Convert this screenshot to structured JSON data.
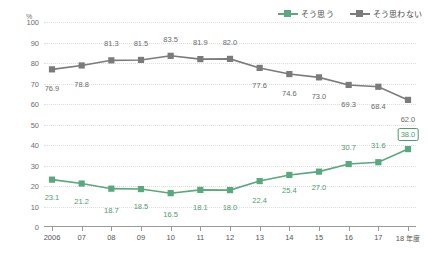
{
  "chart_data": {
    "type": "line",
    "title": "",
    "xlabel": "",
    "ylabel": "",
    "unit_label": "%",
    "x_axis_unit_suffix": "年度",
    "grid": true,
    "legend_position": "top-right",
    "ylim": [
      0,
      100
    ],
    "y_ticks": [
      "100",
      "90",
      "80",
      "70",
      "60",
      "50",
      "40",
      "30",
      "20",
      "10",
      "0"
    ],
    "categories": [
      "2006",
      "07",
      "08",
      "09",
      "10",
      "11",
      "12",
      "13",
      "14",
      "15",
      "16",
      "17",
      "18"
    ],
    "last_category_suffix": "年度",
    "series": [
      {
        "name": "そう思う",
        "color": "#5aa87d",
        "label_color": "#4f9a73",
        "values": [
          23.1,
          21.2,
          18.7,
          18.5,
          16.5,
          18.1,
          18.0,
          22.4,
          25.4,
          27.0,
          30.7,
          31.6,
          38.0
        ],
        "value_labels": [
          "23.1",
          "21.2",
          "18.7",
          "18.5",
          "16.5",
          "18.1",
          "18.0",
          "22.4",
          "25.4",
          "27.0",
          "30.7",
          "31.6",
          "38.0"
        ],
        "highlight_last_label": true
      },
      {
        "name": "そう思わない",
        "color": "#7b7b7b",
        "label_color": "#6a6a6a",
        "values": [
          76.9,
          78.8,
          81.3,
          81.5,
          83.5,
          81.9,
          82.0,
          77.6,
          74.6,
          73.0,
          69.3,
          68.4,
          62.0
        ],
        "value_labels": [
          "76.9",
          "78.8",
          "81.3",
          "81.5",
          "83.5",
          "81.9",
          "82.0",
          "77.6",
          "74.6",
          "73.0",
          "69.3",
          "68.4",
          "62.0"
        ],
        "highlight_last_label": false
      }
    ],
    "label_offsets": {
      "green": [
        18,
        18,
        22,
        18,
        22,
        18,
        18,
        20,
        16,
        16,
        -16,
        -16,
        -16
      ],
      "gray": [
        20,
        20,
        -16,
        -16,
        -16,
        -16,
        -16,
        18,
        20,
        20,
        20,
        20,
        20
      ]
    }
  }
}
